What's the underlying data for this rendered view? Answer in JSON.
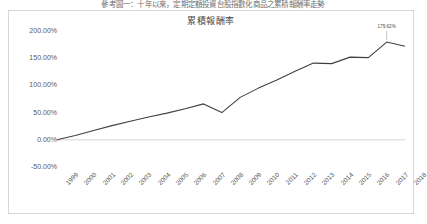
{
  "header": {
    "caption": "參考圖一：十年以來，定期定額投資台股指數化商品之累積報酬率走勢"
  },
  "chart_data": {
    "type": "line",
    "title": "累積報酬率",
    "xlabel": "",
    "ylabel": "",
    "categories": [
      "1999",
      "2000",
      "2001",
      "2002",
      "2003",
      "2004",
      "2005",
      "2006",
      "2007",
      "2008",
      "2009",
      "2010",
      "2011",
      "2012",
      "2013",
      "2014",
      "2015",
      "2016",
      "2017",
      "2018"
    ],
    "series": [
      {
        "name": "累積報酬率",
        "values": [
          0.0,
          8.0,
          17.0,
          26.0,
          34.0,
          42.0,
          49.0,
          57.0,
          66.0,
          50.0,
          78.0,
          95.0,
          110.0,
          126.0,
          141.0,
          140.0,
          152.0,
          151.0,
          179.62,
          172.0
        ]
      }
    ],
    "ylim": [
      -50,
      200
    ],
    "yticks": [
      200,
      150,
      100,
      50,
      0,
      -50
    ],
    "ytick_labels": [
      "200.00%",
      "150.00%",
      "100.00%",
      "50.00%",
      "0.00%",
      "-50.00%"
    ],
    "grid": false,
    "legend": "none",
    "line_color": "#404040",
    "annotations": [
      {
        "category": "2017",
        "value": 179.62,
        "text": "179.62%"
      }
    ]
  }
}
